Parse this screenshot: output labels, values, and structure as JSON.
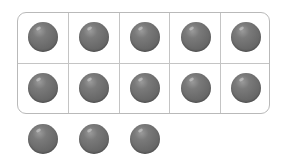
{
  "ten_frame": {
    "rows": 2,
    "columns": 5,
    "filled_cells": 10,
    "frame_color": "#b9b9b9",
    "counter_color": "#6a6a6a"
  },
  "extra_counters": 3,
  "total_counters": 13
}
